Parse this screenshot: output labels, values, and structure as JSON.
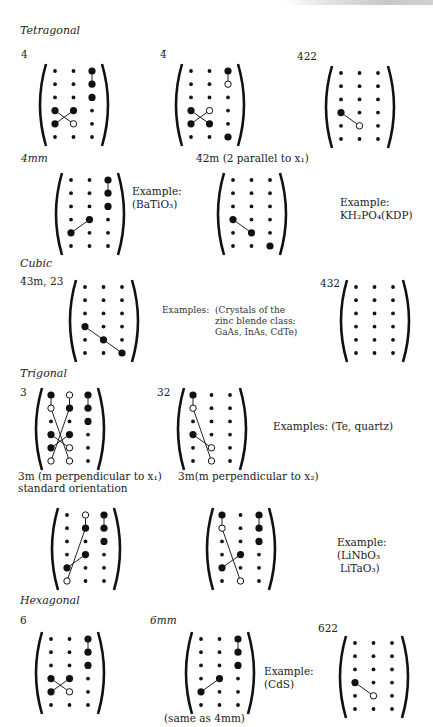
{
  "page_header": "",
  "sections": {
    "tetragonal": "Tetragonal",
    "cubic": "Cubic",
    "trigonal": "Trigonal",
    "hexagonal": "Hexagonal"
  },
  "labels": {
    "t4": "4",
    "t4bar": "4̄",
    "t422": "422",
    "t4mm": "4mm",
    "t42m": "4̄2m (2 parallel to x₁)",
    "c43m": "4̄3m, 23",
    "c432": "432",
    "tr3": "3",
    "tr32": "32",
    "tr3m1_line1": "3m (m perpendicular to x₁)",
    "tr3m1_line2": "standard orientation",
    "tr3m2": "3m(m perpendicular to x₂)",
    "h6": "6",
    "h6mm": "6mm",
    "h622": "622",
    "h6mm_note": "(same as 4mm)"
  },
  "examples": {
    "bati": {
      "line1": "Example:",
      "line2": "(BaTiO₃)"
    },
    "kdp": {
      "line1": "Example:",
      "line2": "KH₂PO₄(KDP)"
    },
    "cubic": {
      "head": "Examples:",
      "line1": "(Crystals of the",
      "line2": "zinc blende class:",
      "line3": "GaAs, InAs, CdTe)"
    },
    "te": {
      "line1": "Examples: (Te, quartz)"
    },
    "linbo": {
      "line1": "Example:",
      "line2": "(LiNbO₃",
      "line3": "LiTaO₃)"
    },
    "cds": {
      "line1": "Example:",
      "line2": "(CdS)"
    }
  },
  "matrices": {
    "t4": {
      "grid": [
        "ssB",
        "ssB",
        "ssB",
        "BBs",
        "BOs",
        "sss"
      ],
      "lines": [
        [
          0,
          2,
          1,
          2
        ],
        [
          3,
          0,
          4,
          1
        ],
        [
          3,
          1,
          4,
          0
        ]
      ]
    },
    "t4bar": {
      "grid": [
        "ssB",
        "ssO",
        "sss",
        "BOs",
        "BBs",
        "ssB"
      ],
      "lines": [
        [
          0,
          2,
          1,
          2
        ],
        [
          3,
          0,
          4,
          1
        ],
        [
          3,
          1,
          4,
          0
        ]
      ]
    },
    "t422": {
      "grid": [
        "sss",
        "sss",
        "sss",
        "Bss",
        "sOs",
        "sss"
      ],
      "lines": [
        [
          3,
          0,
          4,
          1
        ]
      ]
    },
    "t4mm": {
      "grid": [
        "ssB",
        "ssB",
        "ssB",
        "sBs",
        "Bss",
        "sss"
      ],
      "lines": [
        [
          0,
          2,
          1,
          2
        ],
        [
          4,
          0,
          3,
          1
        ]
      ]
    },
    "t42m": {
      "grid": [
        "sss",
        "sss",
        "sss",
        "Bss",
        "sBs",
        "ssB"
      ],
      "lines": [
        [
          3,
          0,
          4,
          1
        ]
      ]
    },
    "c43m": {
      "grid": [
        "sss",
        "sss",
        "sss",
        "Bss",
        "sBs",
        "ssB"
      ],
      "lines": [
        [
          3,
          0,
          4,
          1
        ],
        [
          4,
          1,
          5,
          2
        ]
      ]
    },
    "c432": {
      "grid": [
        "sss",
        "sss",
        "sss",
        "sss",
        "sss",
        "sss"
      ],
      "lines": []
    },
    "tr3": {
      "grid": [
        "BOB",
        "OBB",
        "ssB",
        "BBs",
        "BOs",
        "OOs"
      ],
      "lines": [
        [
          0,
          0,
          1,
          0
        ],
        [
          0,
          1,
          1,
          1
        ],
        [
          0,
          2,
          1,
          2
        ],
        [
          1,
          1,
          5,
          0
        ],
        [
          1,
          0,
          5,
          1
        ],
        [
          3,
          1,
          4,
          0
        ],
        [
          3,
          0,
          4,
          1
        ]
      ]
    },
    "tr32": {
      "grid": [
        "Bss",
        "Oss",
        "sss",
        "Bss",
        "sOs",
        "sOs"
      ],
      "lines": [
        [
          0,
          0,
          1,
          0
        ],
        [
          1,
          0,
          5,
          1
        ],
        [
          3,
          0,
          4,
          1
        ]
      ]
    },
    "tr3m1": {
      "grid": [
        "sOB",
        "sBB",
        "ssB",
        "sBs",
        "Bss",
        "Oss"
      ],
      "lines": [
        [
          0,
          1,
          1,
          1
        ],
        [
          0,
          2,
          1,
          2
        ],
        [
          1,
          1,
          5,
          0
        ],
        [
          3,
          1,
          4,
          0
        ]
      ]
    },
    "tr3m2": {
      "grid": [
        "BsB",
        "OsB",
        "ssB",
        "sBs",
        "Bss",
        "sOs"
      ],
      "lines": [
        [
          0,
          0,
          1,
          0
        ],
        [
          0,
          2,
          1,
          2
        ],
        [
          1,
          0,
          5,
          1
        ],
        [
          4,
          0,
          3,
          1
        ]
      ]
    },
    "h6": {
      "grid": [
        "ssB",
        "ssB",
        "ssB",
        "BBs",
        "BOs",
        "sss"
      ],
      "lines": [
        [
          0,
          2,
          1,
          2
        ],
        [
          3,
          0,
          4,
          1
        ],
        [
          3,
          1,
          4,
          0
        ]
      ]
    },
    "h6mm": {
      "grid": [
        "ssB",
        "ssB",
        "ssB",
        "sBs",
        "Bss",
        "sss"
      ],
      "lines": [
        [
          0,
          2,
          1,
          2
        ],
        [
          4,
          0,
          3,
          1
        ]
      ]
    },
    "h622": {
      "grid": [
        "sss",
        "sss",
        "sss",
        "Bss",
        "sOs",
        "sss"
      ],
      "lines": [
        [
          3,
          0,
          4,
          1
        ]
      ]
    }
  }
}
